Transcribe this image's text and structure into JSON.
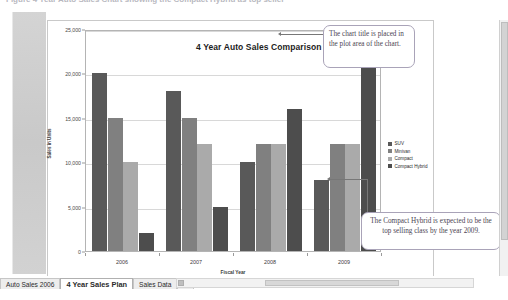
{
  "window": {
    "ribbon_remnant_text": "Figure    4 Year Auto Sales Chart showing the Compact Hybrid as top seller"
  },
  "chart_data": {
    "type": "bar",
    "title": "4 Year Auto Sales Comparison",
    "xlabel": "Fiscal Year",
    "ylabel": "Sales in Units",
    "categories": [
      "2006",
      "2007",
      "2008",
      "2009"
    ],
    "ylim": [
      0,
      25000
    ],
    "yticks": [
      "0",
      "5,000",
      "10,000",
      "15,000",
      "20,000",
      "25,000"
    ],
    "ytick_values": [
      0,
      5000,
      10000,
      15000,
      20000,
      25000
    ],
    "grid": true,
    "legend_position": "right",
    "series": [
      {
        "name": "SUV",
        "color": "#595959",
        "values": [
          20000,
          18000,
          10000,
          8000
        ]
      },
      {
        "name": "Minivan",
        "color": "#808080",
        "values": [
          15000,
          15000,
          12000,
          12000
        ]
      },
      {
        "name": "Compact",
        "color": "#aaaaaa",
        "values": [
          10000,
          12000,
          12000,
          12000
        ]
      },
      {
        "name": "Compact Hybrid",
        "color": "#4d4d4d",
        "values": [
          2000,
          5000,
          16000,
          24000
        ]
      }
    ]
  },
  "annotations": [
    {
      "id": "callout-title",
      "text": "The chart title is placed in the plot area of the chart."
    },
    {
      "id": "callout-hybrid",
      "text": "The Compact Hybrid is expected to be the top selling class by the year 2009."
    }
  ],
  "sheet_tabs": {
    "items": [
      {
        "label": "Auto Sales 2006",
        "active": false
      },
      {
        "label": "4 Year Sales Plan",
        "active": true
      },
      {
        "label": "Sales Data",
        "active": false
      }
    ],
    "new_sheet_label": "↻"
  }
}
